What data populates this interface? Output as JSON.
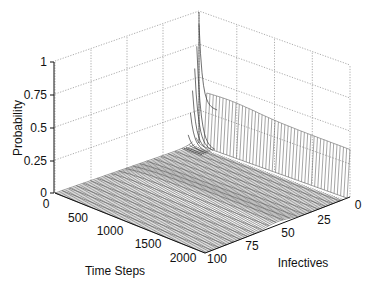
{
  "chart_data": {
    "type": "surface",
    "title": "",
    "xlabel": "Time Steps",
    "ylabel": "Infectives",
    "zlabel": "Probability",
    "x_ticks": [
      "0",
      "500",
      "1000",
      "1500",
      "2000"
    ],
    "y_ticks": [
      "0",
      "25",
      "50",
      "75",
      "100"
    ],
    "z_ticks": [
      "0",
      "0.25",
      "0.5",
      "0.75",
      "1"
    ],
    "xlim": [
      0,
      2000
    ],
    "ylim": [
      0,
      100
    ],
    "zlim": [
      0,
      1
    ],
    "grid": true,
    "series": [
      {
        "name": "P(infectives=0) over time",
        "x": [
          0,
          50,
          100,
          200,
          300,
          500,
          750,
          1000,
          1250,
          1500,
          1750,
          2000
        ],
        "values": [
          1.0,
          0.2,
          0.3,
          0.38,
          0.4,
          0.4,
          0.39,
          0.39,
          0.38,
          0.38,
          0.37,
          0.37
        ]
      },
      {
        "name": "Initial distribution (time 0)",
        "x": [
          0,
          5,
          10,
          25,
          50,
          75,
          100
        ],
        "values": [
          1.0,
          0.1,
          0.02,
          0.0,
          0.0,
          0.0,
          0.0
        ]
      },
      {
        "name": "Quasi-stationary ridge (infectives ~50)",
        "x": [
          0,
          500,
          1000,
          1500,
          2000
        ],
        "values": [
          0.0,
          0.03,
          0.03,
          0.03,
          0.03
        ]
      }
    ]
  },
  "axes": {
    "z_label": "Probability",
    "x_label": "Time Steps",
    "y_label": "Infectives",
    "z_ticks": [
      "0",
      "0.25",
      "0.5",
      "0.75",
      "1"
    ],
    "x_ticks": [
      "0",
      "500",
      "1000",
      "1500",
      "2000"
    ],
    "y_ticks": [
      "0",
      "25",
      "50",
      "75",
      "100"
    ]
  }
}
